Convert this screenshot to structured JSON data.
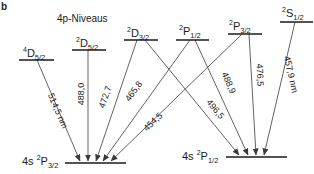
{
  "panel_label": "b",
  "title": "4p-Niveaus",
  "upper_levels": [
    {
      "id": "4D52",
      "prefix_sup": "4",
      "letter": "D",
      "sub": "5/2",
      "x1": 19,
      "x2": 54,
      "y": 60
    },
    {
      "id": "2D52",
      "prefix_sup": "2",
      "letter": "D",
      "sub": "5/2",
      "x1": 72,
      "x2": 106,
      "y": 50
    },
    {
      "id": "2D32",
      "prefix_sup": "2",
      "letter": "D",
      "sub": "3/2",
      "x1": 124,
      "x2": 158,
      "y": 40
    },
    {
      "id": "2P12",
      "prefix_sup": "2",
      "letter": "P",
      "sub": "1/2",
      "x1": 176,
      "x2": 209,
      "y": 40
    },
    {
      "id": "2P32",
      "prefix_sup": "2",
      "letter": "P",
      "sub": "3/2",
      "x1": 228,
      "x2": 262,
      "y": 34
    },
    {
      "id": "2S12",
      "prefix_sup": "2",
      "letter": "S",
      "sub": "1/2",
      "x1": 280,
      "x2": 313,
      "y": 22
    }
  ],
  "lower_levels": [
    {
      "id": "4s2P32",
      "prefix": "4s",
      "prefix_sup": "2",
      "letter": "P",
      "sub": "3/2",
      "x1": 65,
      "x2": 126,
      "y": 163
    },
    {
      "id": "4s2P12",
      "prefix": "4s",
      "prefix_sup": "2",
      "letter": "P",
      "sub": "1/2",
      "x1": 226,
      "x2": 287,
      "y": 157
    }
  ],
  "transitions": [
    {
      "from": "4D52",
      "to": "4s2P32",
      "wavelength": "514,5 nm"
    },
    {
      "from": "2D52",
      "to": "4s2P32",
      "wavelength": "488,0"
    },
    {
      "from": "2D32",
      "to": "4s2P32",
      "wavelength": "472,7"
    },
    {
      "from": "2P12",
      "to": "4s2P32",
      "wavelength": "465,8"
    },
    {
      "from": "2P32",
      "to": "4s2P32",
      "wavelength": "454,5"
    },
    {
      "from": "2D32",
      "to": "4s2P12",
      "wavelength": "496,5"
    },
    {
      "from": "2P12",
      "to": "4s2P12",
      "wavelength": "488,9"
    },
    {
      "from": "2P32",
      "to": "4s2P12",
      "wavelength": "476,5"
    },
    {
      "from": "2S12",
      "to": "4s2P12",
      "wavelength": "457,9 nm"
    }
  ],
  "colors": {
    "ink": "#1a1a1a",
    "arrow": "#3a3a3a",
    "background": "#ffffff"
  }
}
